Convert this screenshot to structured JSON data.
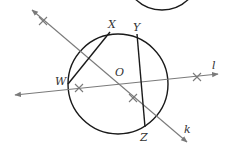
{
  "diagram": {
    "type": "geometry-construction",
    "colors": {
      "circle": "#1a1a1a",
      "chord": "#1a1a1a",
      "line": "#7a7a7a",
      "label": "#333333",
      "background": "#ffffff"
    },
    "circle": {
      "center_label": "O",
      "cx": 118,
      "cy": 84,
      "r": 50
    },
    "partial_circle_top": {
      "cx": 162,
      "cy": -28,
      "r": 38
    },
    "points": [
      {
        "label": "X",
        "x": 110,
        "y": 32,
        "label_x": 108,
        "label_y": 28
      },
      {
        "label": "Y",
        "x": 137,
        "y": 34,
        "label_x": 133,
        "label_y": 31
      },
      {
        "label": "W",
        "x": 68,
        "y": 84,
        "label_x": 55,
        "label_y": 85
      },
      {
        "label": "Z",
        "x": 145,
        "y": 127,
        "label_x": 140,
        "label_y": 141
      },
      {
        "label": "O",
        "x": 118,
        "y": 84,
        "label_x": 115,
        "label_y": 76
      }
    ],
    "chords": [
      {
        "from": "W",
        "to": "X"
      },
      {
        "from": "Y",
        "to": "Z"
      }
    ],
    "lines": [
      {
        "label": "k",
        "x1": 32,
        "y1": 10,
        "x2": 187,
        "y2": 142,
        "label_x": 184,
        "label_y": 133
      },
      {
        "label": "l",
        "x1": 15,
        "y1": 95,
        "x2": 218,
        "y2": 74,
        "label_x": 212,
        "label_y": 69
      }
    ],
    "cross_marks": [
      {
        "x": 43,
        "y": 21,
        "on": "k"
      },
      {
        "x": 133,
        "y": 98,
        "on": "k"
      },
      {
        "x": 79,
        "y": 88,
        "on": "l"
      },
      {
        "x": 197,
        "y": 77,
        "on": "l"
      }
    ]
  }
}
